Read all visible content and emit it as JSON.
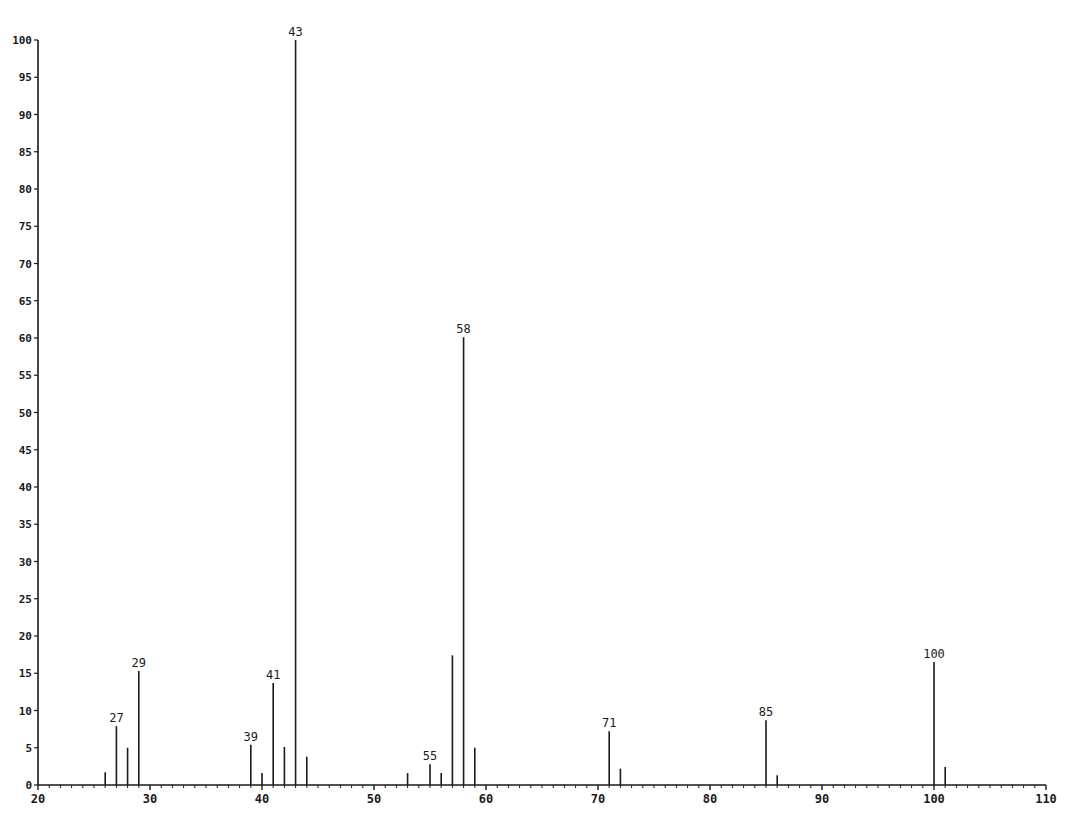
{
  "chart_data": {
    "type": "bar",
    "subtype": "mass-spectrum-stick",
    "title": "",
    "xlabel": "",
    "ylabel": "",
    "xlim": [
      20,
      110
    ],
    "ylim": [
      0,
      100
    ],
    "x_ticks": [
      20,
      30,
      40,
      50,
      60,
      70,
      80,
      90,
      100,
      110
    ],
    "x_tick_labels": [
      "20",
      "30",
      "40",
      "50",
      "60",
      "70",
      "80",
      "90",
      "100",
      "110"
    ],
    "x_minor_step": 1,
    "y_ticks": [
      0,
      5,
      10,
      15,
      20,
      25,
      30,
      35,
      40,
      45,
      50,
      55,
      60,
      65,
      70,
      75,
      80,
      85,
      90,
      95,
      100
    ],
    "y_tick_labels": [
      "0",
      "5",
      "10",
      "15",
      "20",
      "25",
      "30",
      "35",
      "40",
      "45",
      "50",
      "55",
      "60",
      "65",
      "70",
      "75",
      "80",
      "85",
      "90",
      "95",
      "100"
    ],
    "grid": false,
    "legend": null,
    "peaks": [
      {
        "mz": 26,
        "intensity": 1.7,
        "label": ""
      },
      {
        "mz": 27,
        "intensity": 7.9,
        "label": "27"
      },
      {
        "mz": 28,
        "intensity": 5.0,
        "label": ""
      },
      {
        "mz": 29,
        "intensity": 15.3,
        "label": "29"
      },
      {
        "mz": 39,
        "intensity": 5.4,
        "label": "39"
      },
      {
        "mz": 40,
        "intensity": 1.6,
        "label": ""
      },
      {
        "mz": 41,
        "intensity": 13.7,
        "label": "41"
      },
      {
        "mz": 42,
        "intensity": 5.1,
        "label": ""
      },
      {
        "mz": 43,
        "intensity": 100,
        "label": "43"
      },
      {
        "mz": 44,
        "intensity": 3.8,
        "label": ""
      },
      {
        "mz": 53,
        "intensity": 1.6,
        "label": ""
      },
      {
        "mz": 55,
        "intensity": 2.8,
        "label": "55"
      },
      {
        "mz": 56,
        "intensity": 1.6,
        "label": ""
      },
      {
        "mz": 57,
        "intensity": 17.4,
        "label": ""
      },
      {
        "mz": 58,
        "intensity": 60.1,
        "label": "58"
      },
      {
        "mz": 59,
        "intensity": 5.0,
        "label": ""
      },
      {
        "mz": 71,
        "intensity": 7.2,
        "label": "71"
      },
      {
        "mz": 72,
        "intensity": 2.2,
        "label": ""
      },
      {
        "mz": 85,
        "intensity": 8.7,
        "label": "85"
      },
      {
        "mz": 86,
        "intensity": 1.3,
        "label": ""
      },
      {
        "mz": 100,
        "intensity": 16.5,
        "label": "100"
      },
      {
        "mz": 101,
        "intensity": 2.4,
        "label": ""
      }
    ],
    "categories": [
      26,
      27,
      28,
      29,
      39,
      40,
      41,
      42,
      43,
      44,
      53,
      55,
      56,
      57,
      58,
      59,
      71,
      72,
      85,
      86,
      100,
      101
    ],
    "values": [
      1.7,
      7.9,
      5.0,
      15.3,
      5.4,
      1.6,
      13.7,
      5.1,
      100,
      3.8,
      1.6,
      2.8,
      1.6,
      17.4,
      60.1,
      5.0,
      7.2,
      2.2,
      8.7,
      1.3,
      16.5,
      2.4
    ],
    "colors": {
      "line": "#1a1a1a",
      "background": "#ffffff"
    }
  }
}
